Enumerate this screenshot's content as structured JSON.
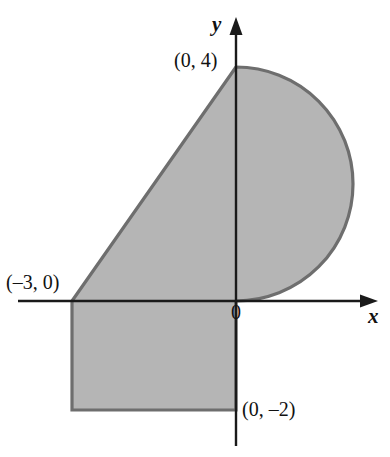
{
  "figure": {
    "type": "coordinate-plane-shaded-region",
    "background_color": "#ffffff",
    "axis_color": "#1a1a1a",
    "region_fill_color": "#b5b5b5",
    "region_stroke_color": "#6e6e6e",
    "axes": {
      "x_label": "x",
      "y_label": "y",
      "origin_label": "0",
      "x_axis_pixel_y": 301,
      "y_axis_pixel_x": 236,
      "x_axis_span_px": [
        18,
        378
      ],
      "y_axis_span_px": [
        18,
        446
      ],
      "x_arrow": "right-arrow",
      "y_arrow": "up-arrow"
    },
    "labels": [
      {
        "name": "point-0-4",
        "text": "(0, 4)",
        "x": 174,
        "y": 50
      },
      {
        "name": "point-neg3-0",
        "text": "(–3, 0)",
        "x": 6,
        "y": 272
      },
      {
        "name": "point-0-neg2",
        "text": "(0, –2)",
        "x": 242,
        "y": 399
      },
      {
        "name": "origin",
        "text": "0",
        "x": 231,
        "y": 302
      },
      {
        "name": "axis-x",
        "text": "x",
        "x": 368,
        "y": 306
      },
      {
        "name": "axis-y",
        "text": "y",
        "x": 212,
        "y": 14
      }
    ],
    "region": {
      "description": "Shaded region: quarter-ish triangle from (-3,0) to (0,4), semicircular arc on the right from (0,4) down to origin, plus rectangle from (-3,0) to (0,-2)",
      "vertices_math": [
        {
          "label": "(–3, 0)",
          "x": -3,
          "y": 0
        },
        {
          "label": "(0, 4)",
          "x": 0,
          "y": 4
        },
        {
          "label": "(0, –2)",
          "x": 0,
          "y": -2
        }
      ],
      "semicircle": {
        "center_math": [
          0,
          2
        ],
        "radius_math": 2,
        "side": "right"
      },
      "pixels": {
        "left_x": 72,
        "top_y": 67,
        "bottom_y": 410,
        "axis_x": 236,
        "arc_rightmost_x": 346,
        "arc_center_y": 184,
        "arc_radius": 117
      }
    }
  }
}
